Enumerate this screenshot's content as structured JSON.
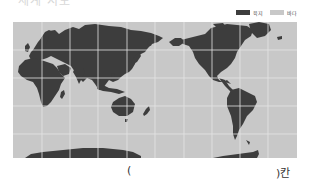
{
  "title": "세계 지도",
  "legend": {
    "items": [
      {
        "label": "육지",
        "color": "#3d3d3d"
      },
      {
        "label": "바다",
        "color": "#c8c8c8"
      }
    ]
  },
  "map": {
    "projection": "Pacific-centered equirectangular",
    "land_color": "#3d3d3d",
    "sea_color": "#c8c8c8",
    "grid_color": "#e4e4e4"
  },
  "answer": {
    "open": "(",
    "close": ")칸"
  }
}
